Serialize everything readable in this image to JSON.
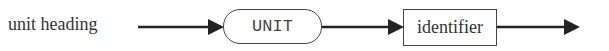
{
  "diagram": {
    "type": "syntax-diagram",
    "rule_name": "unit heading",
    "nodes": [
      {
        "kind": "terminal",
        "shape": "rounded",
        "text": "UNIT"
      },
      {
        "kind": "nonterminal",
        "shape": "rectangle",
        "text": "identifier"
      }
    ],
    "edges": [
      {
        "from": "start",
        "to": "UNIT"
      },
      {
        "from": "UNIT",
        "to": "identifier"
      },
      {
        "from": "identifier",
        "to": "end"
      }
    ],
    "stroke_color": "#222222"
  }
}
